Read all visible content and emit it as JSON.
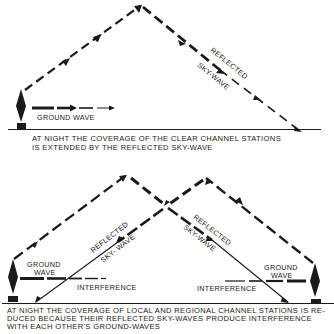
{
  "colors": {
    "background": "#ffffff",
    "ink": "#1a1a1a"
  },
  "top_diagram": {
    "labels": {
      "ground_wave": "GROUND WAVE",
      "reflected": "REFLECTED",
      "sky_wave": "SKY-WAVE"
    },
    "caption": {
      "line1": "AT NIGHT THE COVERAGE OF THE CLEAR CHANNEL STATIONS",
      "line2": "IS EXTENDED BY THE REFLECTED SKY-WAVE"
    }
  },
  "bottom_diagram": {
    "labels": {
      "left_ground": "GROUND",
      "left_wave": "WAVE",
      "left_interference": "INTERFERENCE",
      "left_reflected": "REFLECTED",
      "left_sky_wave": "SKY- WAVE",
      "right_reflected": "REFLECTED",
      "right_sky_wave": "SKY-WAVE",
      "right_ground": "GROUND",
      "right_wave": "WAVE",
      "right_interference": "INTERFERENCE"
    },
    "caption": {
      "line1": "AT NIGHT THE COVERAGE OF LOCAL AND REGIONAL CHANNEL STATIONS IS RE-",
      "line2": "DUCED BECAUSE THEIR REFLECTED SKY-WAVES PRODUCE INTERFERENCE",
      "line3": "WITH EACH OTHER'S GROUND-WAVES"
    }
  }
}
